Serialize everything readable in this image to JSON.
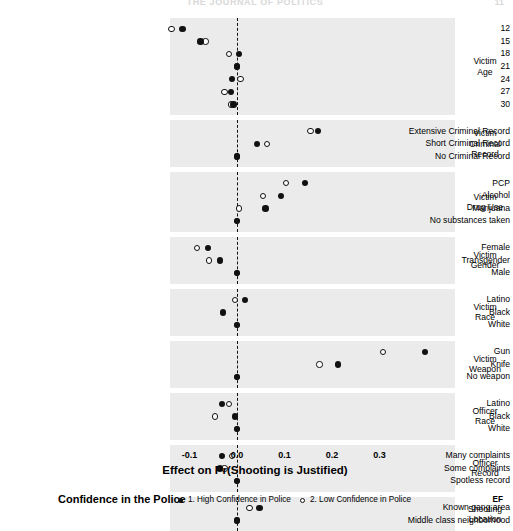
{
  "page": {
    "running_head": "THE JOURNAL OF POLITICS",
    "folio": "11"
  },
  "legend": {
    "title": "Confidence in the Police",
    "entries": [
      {
        "marker": "filled-circle",
        "label": "1. High Confidence in Police"
      },
      {
        "marker": "open-circle",
        "label": "2. Low Confidence in Police"
      }
    ],
    "corner_note": "EF"
  },
  "chart_data": {
    "type": "scatter",
    "title": "",
    "xlabel": "Effect on Pr(Shooting is Justified)",
    "ylabel": "",
    "xlim": [
      -0.13,
      0.43
    ],
    "xticks": [
      -0.1,
      0.0,
      0.1,
      0.2,
      0.3
    ],
    "xticklabels": [
      "-0.1",
      "0.0",
      "0.1",
      "0.2",
      "0.3"
    ],
    "grid": false,
    "reference_line": 0.0,
    "legend_position": "bottom",
    "series": [
      {
        "name": "1. High Confidence in Police",
        "marker": "filled-circle",
        "color": "#111111"
      },
      {
        "name": "2. Low Confidence in Police",
        "marker": "open-circle",
        "color": "#ffffff"
      }
    ],
    "panels": [
      {
        "title": "Victim Age",
        "title_lines": [
          "Victim",
          "Age"
        ],
        "rows": [
          {
            "label": "12",
            "high": -0.115,
            "low": -0.138,
            "baseline": false
          },
          {
            "label": "15",
            "high": -0.077,
            "low": -0.066,
            "baseline": false
          },
          {
            "label": "18",
            "high": 0.004,
            "low": -0.017,
            "baseline": false
          },
          {
            "label": "21",
            "high": 0.0,
            "low": 0.0,
            "baseline": true
          },
          {
            "label": "24",
            "high": -0.01,
            "low": 0.007,
            "baseline": false
          },
          {
            "label": "27",
            "high": -0.012,
            "low": -0.026,
            "baseline": false
          },
          {
            "label": "30",
            "high": -0.007,
            "low": -0.012,
            "baseline": false
          }
        ]
      },
      {
        "title": "Victim Criminal Record",
        "title_lines": [
          "Victim",
          "Criminal",
          "Record"
        ],
        "rows": [
          {
            "label": "Extensive Criminal Record",
            "high": 0.17,
            "low": 0.155,
            "baseline": false
          },
          {
            "label": "Short Criminal Record",
            "high": 0.042,
            "low": 0.063,
            "baseline": false
          },
          {
            "label": "No Criminal Record",
            "high": 0.0,
            "low": 0.0,
            "baseline": true
          }
        ]
      },
      {
        "title": "Victim Drug Use",
        "title_lines": [
          "Victim",
          "Drug Use"
        ],
        "rows": [
          {
            "label": "PCP",
            "high": 0.143,
            "low": 0.103,
            "baseline": false
          },
          {
            "label": "Alcohol",
            "high": 0.093,
            "low": 0.055,
            "baseline": false
          },
          {
            "label": "Marijuana",
            "high": 0.06,
            "low": 0.004,
            "baseline": false
          },
          {
            "label": "No substances taken",
            "high": 0.0,
            "low": 0.0,
            "baseline": true
          }
        ]
      },
      {
        "title": "Victim Gender",
        "title_lines": [
          "Victim",
          "Gender"
        ],
        "rows": [
          {
            "label": "Female",
            "high": -0.061,
            "low": -0.084,
            "baseline": false
          },
          {
            "label": "Transgender",
            "high": -0.036,
            "low": -0.059,
            "baseline": false
          },
          {
            "label": "Male",
            "high": 0.0,
            "low": 0.0,
            "baseline": true
          }
        ]
      },
      {
        "title": "Victim Race",
        "title_lines": [
          "Victim",
          "Race"
        ],
        "rows": [
          {
            "label": "Latino",
            "high": 0.017,
            "low": -0.004,
            "baseline": false
          },
          {
            "label": "Black",
            "high": -0.029,
            "low": null,
            "baseline": false
          },
          {
            "label": "White",
            "high": 0.0,
            "low": 0.0,
            "baseline": true
          }
        ]
      },
      {
        "title": "Victim Weapon",
        "title_lines": [
          "Victim",
          "Weapon"
        ],
        "rows": [
          {
            "label": "Gun",
            "high": 0.396,
            "low": 0.308,
            "baseline": false
          },
          {
            "label": "Knife",
            "high": 0.212,
            "low": 0.174,
            "baseline": false
          },
          {
            "label": "No weapon",
            "high": 0.0,
            "low": 0.0,
            "baseline": true
          }
        ]
      },
      {
        "title": "Officer Race",
        "title_lines": [
          "Officer",
          "Race"
        ],
        "rows": [
          {
            "label": "Latino",
            "high": -0.032,
            "low": -0.017,
            "baseline": false
          },
          {
            "label": "Black",
            "high": -0.004,
            "low": -0.046,
            "baseline": false
          },
          {
            "label": "White",
            "high": 0.0,
            "low": 0.0,
            "baseline": true
          }
        ]
      },
      {
        "title": "Officer Record",
        "title_lines": [
          "Officer",
          "Record"
        ],
        "rows": [
          {
            "label": "Many complaints",
            "high": -0.032,
            "low": -0.011,
            "baseline": false
          },
          {
            "label": "Some complaints",
            "high": -0.036,
            "low": -0.026,
            "baseline": false
          },
          {
            "label": "Spotless record",
            "high": 0.0,
            "low": 0.0,
            "baseline": true
          }
        ]
      },
      {
        "title": "Shooting Location",
        "title_lines": [
          "Shooting",
          "Location"
        ],
        "rows": [
          {
            "label": "Known gang area",
            "high": 0.047,
            "low": 0.026,
            "baseline": false
          },
          {
            "label": "Middle class neighborhood",
            "high": 0.0,
            "low": 0.0,
            "baseline": true
          }
        ]
      }
    ]
  }
}
